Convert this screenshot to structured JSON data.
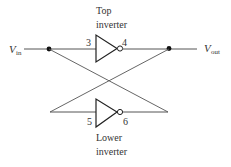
{
  "diagram": {
    "input_label": {
      "main": "V",
      "sub": "in"
    },
    "output_label": {
      "main": "V",
      "sub": "out"
    },
    "top_inverter": {
      "caption_line1": "Top",
      "caption_line2": "inverter",
      "input_pin": "3",
      "output_pin": "4"
    },
    "lower_inverter": {
      "caption_line1": "Lower",
      "caption_line2": "inverter",
      "input_pin": "5",
      "output_pin": "6"
    },
    "colors": {
      "line": "#555555",
      "fill": "#111111",
      "background": "#ffffff"
    }
  }
}
